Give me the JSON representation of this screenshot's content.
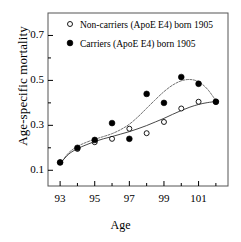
{
  "chart_data": {
    "type": "scatter",
    "title": "",
    "xlabel": "Age",
    "ylabel": "Age-specific mortality",
    "xlim": [
      92.3,
      102.7
    ],
    "ylim": [
      0.03,
      0.8
    ],
    "xticks": [
      93,
      95,
      97,
      99,
      101
    ],
    "xticks_minor": [
      94,
      96,
      98,
      100,
      102
    ],
    "yticks": [
      0.1,
      0.3,
      0.5,
      0.7
    ],
    "ytick_labels": [
      "0.1",
      "0.3",
      "0.5",
      "0.7"
    ],
    "grid": false,
    "legend_position": "top-left",
    "x": [
      93,
      94,
      95,
      96,
      97,
      98,
      99,
      100,
      101,
      102
    ],
    "series": [
      {
        "name": "Non-carriers (ApoE E4) born 1905",
        "marker": "open-circle",
        "values": [
          0.135,
          0.195,
          0.225,
          0.24,
          0.285,
          0.265,
          0.315,
          0.375,
          0.405,
          0.405
        ],
        "fit": [
          [
            93,
            0.13
          ],
          [
            93.5,
            0.172
          ],
          [
            94,
            0.196
          ],
          [
            94.5,
            0.213
          ],
          [
            95,
            0.228
          ],
          [
            95.5,
            0.24
          ],
          [
            96,
            0.25
          ],
          [
            96.5,
            0.261
          ],
          [
            97,
            0.272
          ],
          [
            97.5,
            0.285
          ],
          [
            98,
            0.299
          ],
          [
            98.5,
            0.315
          ],
          [
            99,
            0.331
          ],
          [
            99.5,
            0.349
          ],
          [
            100,
            0.366
          ],
          [
            100.5,
            0.381
          ],
          [
            101,
            0.393
          ],
          [
            101.5,
            0.401
          ],
          [
            102,
            0.406
          ]
        ]
      },
      {
        "name": "Carriers (ApoE E4) born 1905",
        "marker": "filled-circle",
        "values": [
          0.135,
          0.2,
          0.235,
          0.31,
          0.24,
          0.44,
          0.4,
          0.515,
          0.485,
          0.405
        ],
        "fit": [
          [
            93,
            0.128
          ],
          [
            93.5,
            0.178
          ],
          [
            94,
            0.206
          ],
          [
            94.5,
            0.224
          ],
          [
            95,
            0.238
          ],
          [
            95.5,
            0.25
          ],
          [
            96,
            0.263
          ],
          [
            96.5,
            0.281
          ],
          [
            97,
            0.305
          ],
          [
            97.5,
            0.338
          ],
          [
            98,
            0.376
          ],
          [
            98.5,
            0.414
          ],
          [
            99,
            0.45
          ],
          [
            99.5,
            0.479
          ],
          [
            100,
            0.498
          ],
          [
            100.5,
            0.504
          ],
          [
            101,
            0.494
          ],
          [
            101.5,
            0.462
          ],
          [
            102,
            0.41
          ]
        ]
      }
    ]
  },
  "legend": {
    "items": [
      {
        "label": "Non-carriers (ApoE E4) born 1905",
        "marker": "open-circle"
      },
      {
        "label": "Carriers (ApoE E4) born 1905",
        "marker": "filled-circle"
      }
    ]
  },
  "axes": {
    "x_title": "Age",
    "y_title": "Age-specific mortality",
    "x_tick_labels": [
      "93",
      "95",
      "97",
      "99",
      "101"
    ],
    "y_tick_labels": [
      "0.1",
      "0.3",
      "0.5",
      "0.7"
    ]
  },
  "colors": {
    "foreground": "#000000",
    "background": "#ffffff",
    "frame": "#555555",
    "curve": "#333333"
  }
}
